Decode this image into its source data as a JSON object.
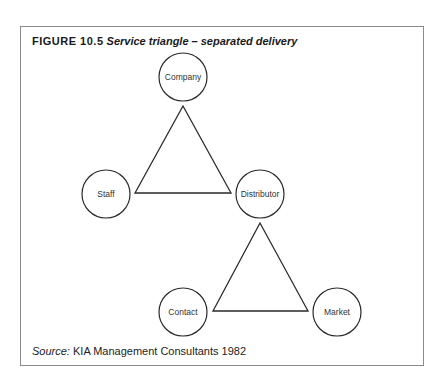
{
  "figure": {
    "number": "FIGURE 10.5",
    "caption": "Service triangle – separated delivery"
  },
  "nodes": [
    {
      "id": "company",
      "label": "Company",
      "cx": 183,
      "cy": 77,
      "r": 24
    },
    {
      "id": "staff",
      "label": "Staff",
      "cx": 106,
      "cy": 194,
      "r": 24
    },
    {
      "id": "distributor",
      "label": "Distributor",
      "cx": 260,
      "cy": 194,
      "r": 24
    },
    {
      "id": "contact",
      "label": "Contact",
      "cx": 183,
      "cy": 312,
      "r": 24
    },
    {
      "id": "market",
      "label": "Market",
      "cx": 337,
      "cy": 312,
      "r": 24
    }
  ],
  "triangles": [
    {
      "id": "upper-triangle",
      "vertices": [
        "company",
        "staff",
        "distributor"
      ],
      "points": "183,106 135,193 231,193"
    },
    {
      "id": "lower-triangle",
      "vertices": [
        "distributor",
        "contact",
        "market"
      ],
      "points": "260,223 213,311 308,311"
    }
  ],
  "source": {
    "label": "Source:",
    "text": "KIA Management Consultants 1982"
  },
  "colors": {
    "stroke": "#2a2a2a",
    "frame": "#8a8a8a",
    "text": "#1a1a1a"
  }
}
